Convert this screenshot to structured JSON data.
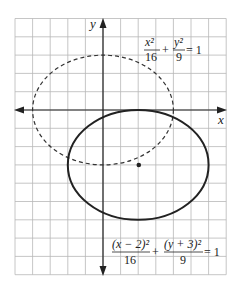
{
  "diagram": {
    "type": "coordinate-plane-ellipses",
    "grid": {
      "x_min": -5,
      "x_max": 7,
      "y_min": -9,
      "y_max": 5,
      "step": 1
    },
    "axes": {
      "x_label": "x",
      "y_label": "y"
    },
    "curves": [
      {
        "name": "original-ellipse",
        "style": "dashed",
        "center": [
          0,
          0
        ],
        "a": 4,
        "b": 3,
        "equation": {
          "term1_num": "x²",
          "term1_den": "16",
          "op": "+",
          "term2_num": "y²",
          "term2_den": "9",
          "rhs": "= 1"
        }
      },
      {
        "name": "translated-ellipse",
        "style": "solid",
        "center": [
          2,
          -3
        ],
        "a": 4,
        "b": 3,
        "center_marked": true,
        "equation": {
          "term1_num": "(x − 2)²",
          "term1_den": "16",
          "op": "+",
          "term2_num": "(y + 3)²",
          "term2_den": "9",
          "rhs": "= 1"
        }
      }
    ],
    "colors": {
      "curve": "#222222",
      "grid": "#b8b8b8",
      "background": "#ffffff"
    }
  }
}
